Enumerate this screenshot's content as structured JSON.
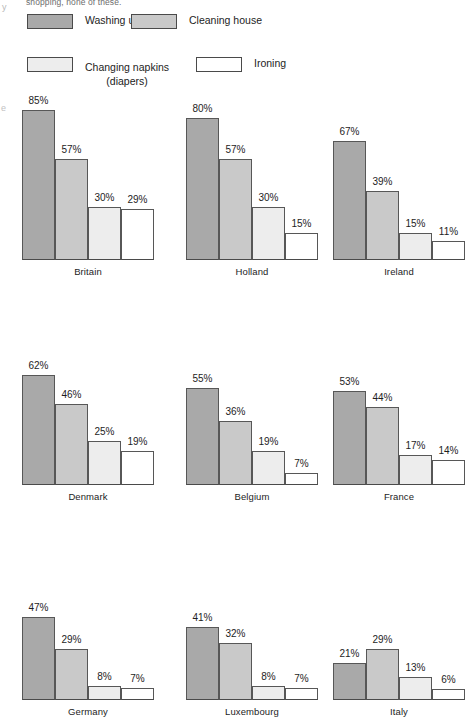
{
  "header": {
    "cutoff_text": "shopping, none of these."
  },
  "legend": {
    "items": [
      {
        "label": "Washing up",
        "sub": "",
        "color": "#a9a9a9",
        "name": "washing-up"
      },
      {
        "label": "Cleaning house",
        "sub": "",
        "color": "#c9c9c9",
        "name": "cleaning-house"
      },
      {
        "label": "Changing napkins",
        "sub": "(diapers)",
        "color": "#ededed",
        "name": "changing-napkins"
      },
      {
        "label": "Ironing",
        "sub": "",
        "color": "#ffffff",
        "name": "ironing"
      }
    ]
  },
  "chart_data": {
    "type": "bar",
    "title": "",
    "xlabel": "",
    "ylabel": "",
    "ylim": [
      0,
      100
    ],
    "unit": "%",
    "grid": false,
    "legend_position": "top",
    "categories": [
      "Washing up",
      "Cleaning house",
      "Changing napkins (diapers)",
      "Ironing"
    ],
    "panel_layout": {
      "rows": 3,
      "cols": 3
    },
    "panels": [
      {
        "country": "Britain",
        "values": [
          85,
          57,
          30,
          29
        ],
        "labels": [
          "85%",
          "57%",
          "30%",
          "29%"
        ]
      },
      {
        "country": "Holland",
        "values": [
          80,
          57,
          30,
          15
        ],
        "labels": [
          "80%",
          "57%",
          "30%",
          "15%"
        ]
      },
      {
        "country": "Ireland",
        "values": [
          67,
          39,
          15,
          11
        ],
        "labels": [
          "67%",
          "39%",
          "15%",
          "11%"
        ]
      },
      {
        "country": "Denmark",
        "values": [
          62,
          46,
          25,
          19
        ],
        "labels": [
          "62%",
          "46%",
          "25%",
          "19%"
        ]
      },
      {
        "country": "Belgium",
        "values": [
          55,
          36,
          19,
          7
        ],
        "labels": [
          "55%",
          "36%",
          "19%",
          "7%"
        ]
      },
      {
        "country": "France",
        "values": [
          53,
          44,
          17,
          14
        ],
        "labels": [
          "53%",
          "44%",
          "17%",
          "14%"
        ]
      },
      {
        "country": "Germany",
        "values": [
          47,
          29,
          8,
          7
        ],
        "labels": [
          "47%",
          "29%",
          "8%",
          "7%"
        ]
      },
      {
        "country": "Luxembourg",
        "values": [
          41,
          32,
          8,
          7
        ],
        "labels": [
          "41%",
          "32%",
          "8%",
          "7%"
        ]
      },
      {
        "country": "Italy",
        "values": [
          21,
          29,
          13,
          6
        ],
        "labels": [
          "21%",
          "29%",
          "13%",
          "6%"
        ]
      }
    ],
    "series_colors": [
      "#a9a9a9",
      "#c9c9c9",
      "#ededed",
      "#ffffff"
    ]
  }
}
